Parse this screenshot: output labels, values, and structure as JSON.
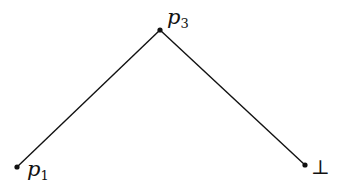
{
  "diagram": {
    "type": "graph",
    "edges": [
      {
        "from": "p1",
        "to": "p3"
      },
      {
        "from": "p3",
        "to": "bottom"
      }
    ],
    "nodes": [
      {
        "id": "p1",
        "x": 17,
        "y": 167,
        "label_base": "p",
        "label_sub": "1"
      },
      {
        "id": "p3",
        "x": 160,
        "y": 30,
        "label_base": "p",
        "label_sub": "3"
      },
      {
        "id": "bottom",
        "x": 305,
        "y": 165,
        "label": "⊥"
      }
    ],
    "stroke_color": "#111111",
    "background": "#ffffff"
  }
}
